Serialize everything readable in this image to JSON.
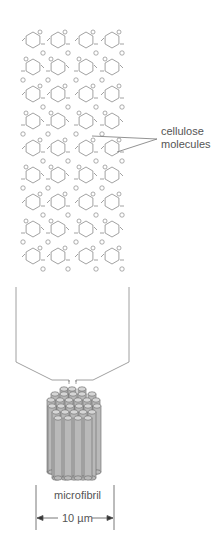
{
  "diagram": {
    "labels": {
      "cellulose_line1": "cellulose",
      "cellulose_line2": "molecules",
      "microfibril": "microfibril",
      "scale": "10 µm"
    },
    "chains": 4,
    "rings_per_chain": 9,
    "colors": {
      "line": "#8a8a8a",
      "rod_fill": "#b9b9b9",
      "rod_top": "#d6d6d6",
      "text": "#555555"
    }
  }
}
